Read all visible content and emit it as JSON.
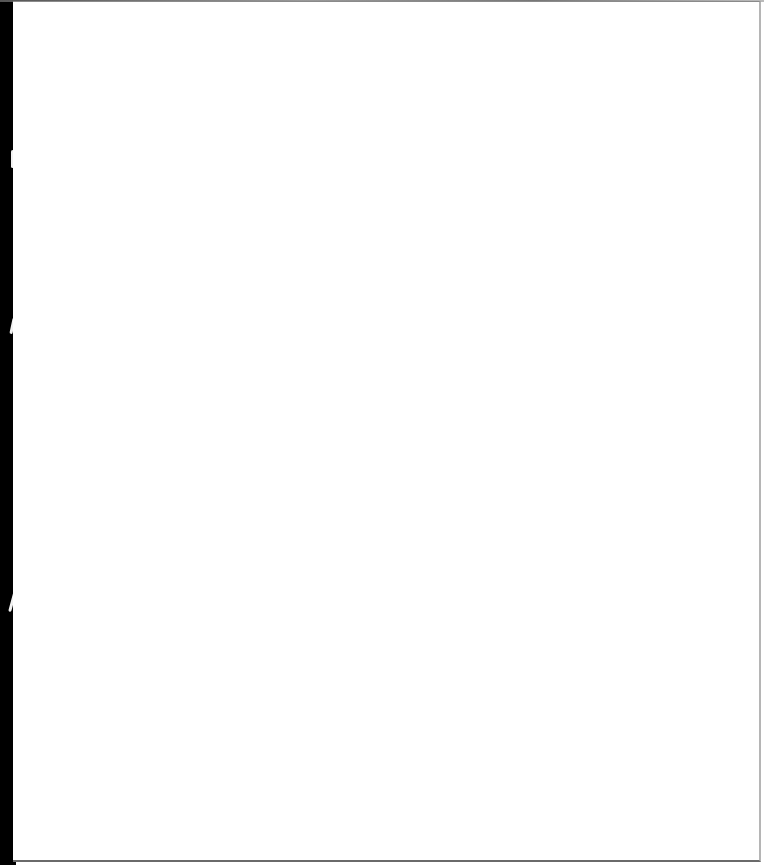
{
  "document": {
    "type": "scanned-page",
    "content": "",
    "colors": {
      "paper": "#ffffff",
      "scan_background": "#000000",
      "edge_shadow": "#6a6a6a"
    }
  }
}
